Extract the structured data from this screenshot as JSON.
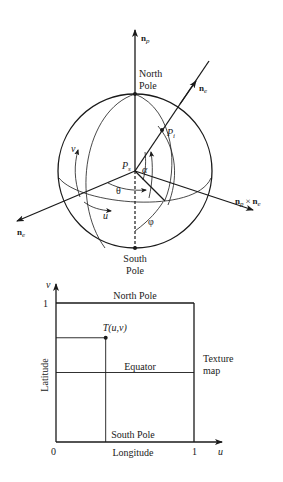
{
  "sphere_figure": {
    "vectors": {
      "n_p": {
        "base": "n",
        "sub": "p"
      },
      "n_e": {
        "base": "n",
        "sub": "e"
      },
      "n_cross": {
        "base": "n",
        "sub": "p",
        "times": "×",
        "base2": "n",
        "sub2": "e"
      },
      "n_c": {
        "base": "n",
        "sub": "e"
      }
    },
    "labels": {
      "north_pole_line1": "North",
      "north_pole_line2": "Pole",
      "south_pole_line1": "South",
      "south_pole_line2": "Pole",
      "center_point": "P",
      "center_point_sub": "s",
      "intersect_point": "P",
      "intersect_point_sub": "i",
      "v": "v",
      "u": "u",
      "theta": "θ",
      "alpha": "α",
      "phi": "φ"
    }
  },
  "texture_map": {
    "y_axis_letter": "v",
    "x_axis_letter": "u",
    "y_tick_1": "1",
    "x_tick_0": "0",
    "x_tick_1": "1",
    "top_label": "North Pole",
    "middle_label": "Equator",
    "bottom_label": "South Pole",
    "point_label": "T(u,v)",
    "y_axis_title": "Latitude",
    "x_axis_title": "Longitude",
    "side_label_line1": "Texture",
    "side_label_line2": "map",
    "point_uv": [
      0.36,
      0.75
    ],
    "equator_v": 0.5
  }
}
